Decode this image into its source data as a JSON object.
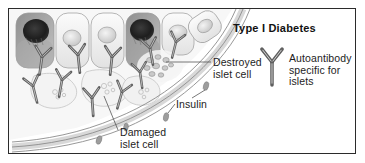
{
  "figure": {
    "title": "Type I Diabetes",
    "palette": {
      "background": "#ffffff",
      "border": "#2b2b2b",
      "text": "#1d1d1d",
      "membrane_fill": "#e3e3e3",
      "membrane_stroke": "#8a8a8a",
      "antibody_stroke": "#5a5a5a",
      "cell_pale": "#f2f2f2",
      "cell_mid": "#c9c9c9",
      "cell_dark": "#4a4a4a",
      "nucleus_pale": "#dcdcdc",
      "insulin_granule": "#9a9a9a",
      "leader_line": "#555555"
    }
  },
  "labels": {
    "destroyed": "Destroyed\nislet cell",
    "autoantibody": "Autoantibody\nspecific for\nislets",
    "insulin": "Insulin",
    "damaged": "Damaged\nislet cell"
  },
  "legend": {
    "antibody_icon": "antibody-y-icon",
    "antibody_text": "Autoantibody\nspecific for\nislets"
  },
  "structures": {
    "membrane": {
      "name": "islet-basement-membrane",
      "description": "double-lined curved band sweeping from upper right to lower left"
    },
    "upper_cells": [
      {
        "id": "cell-1",
        "state": "damaged-dark",
        "nucleus": "dark"
      },
      {
        "id": "cell-2",
        "state": "intact-pale",
        "nucleus": "pale"
      },
      {
        "id": "cell-3",
        "state": "intact-pale",
        "nucleus": "pale"
      },
      {
        "id": "cell-4",
        "state": "damaged-dark",
        "nucleus": "dark"
      },
      {
        "id": "cell-5",
        "state": "intact-pale",
        "nucleus": "pale"
      },
      {
        "id": "cell-6",
        "state": "intact-tilted",
        "nucleus": "pale"
      }
    ],
    "destroyed_cell": {
      "id": "destroyed-islet-cell",
      "description": "scattered cellular fragments / debris cluster"
    },
    "damaged_cells": [
      {
        "id": "damaged-islet-cell-1",
        "description": "pale irregular cell with granule cluster"
      },
      {
        "id": "damaged-islet-cell-2",
        "description": "pale irregular cell with granule cluster"
      },
      {
        "id": "damaged-islet-cell-3",
        "description": "pale irregular cell with granule cluster"
      }
    ],
    "antibody_count": 10,
    "insulin_granule_count": 4
  }
}
